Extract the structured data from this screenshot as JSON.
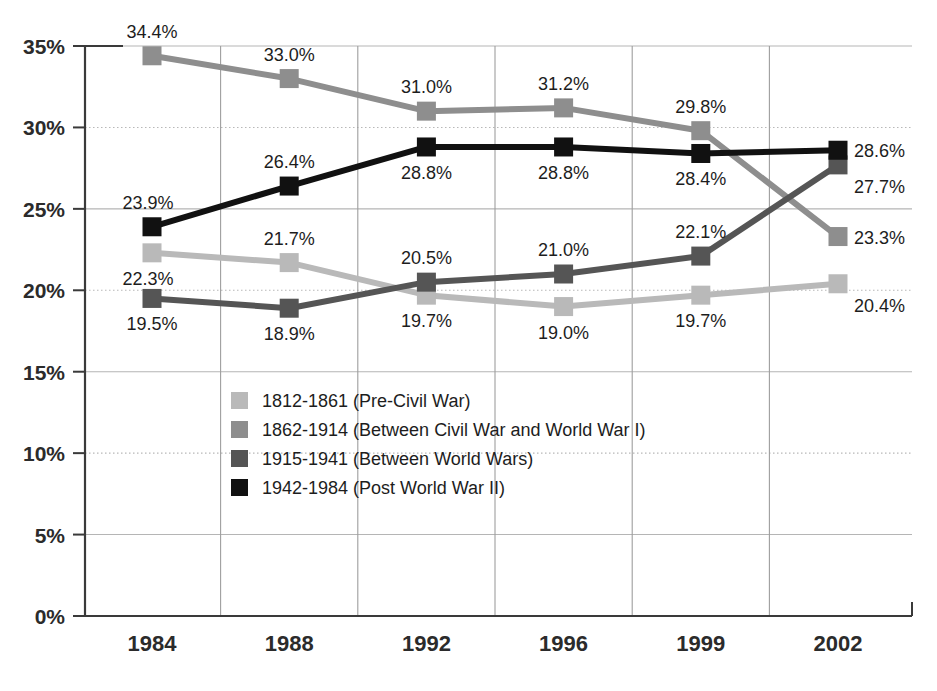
{
  "chart_data": {
    "type": "line",
    "title": "",
    "xlabel": "",
    "ylabel": "",
    "categories": [
      "1984",
      "1988",
      "1992",
      "1996",
      "1999",
      "2002"
    ],
    "ylim": [
      0,
      35
    ],
    "ytick_labels": [
      "0%",
      "5%",
      "10%",
      "15%",
      "20%",
      "25%",
      "30%",
      "35%"
    ],
    "ytick_values": [
      0,
      5,
      10,
      15,
      20,
      25,
      30,
      35
    ],
    "grid": "horizontal-and-vertical",
    "legend_position": "inside-center-left",
    "value_suffix": "%",
    "series": [
      {
        "name": "1812-1861 (Pre-Civil War)",
        "color": "#b9b9b9",
        "values": [
          22.3,
          21.7,
          19.7,
          19.0,
          19.7,
          20.4
        ],
        "labels": [
          "22.3%",
          "21.7%",
          "19.7%",
          "19.0%",
          "19.7%",
          "20.4%"
        ],
        "label_positions": [
          "below-left",
          "above",
          "below",
          "below",
          "below",
          "below-right"
        ]
      },
      {
        "name": "1862-1914 (Between Civil War and World War I)",
        "color": "#8e8e8e",
        "values": [
          34.4,
          33.0,
          31.0,
          31.2,
          29.8,
          23.3
        ],
        "labels": [
          "34.4%",
          "33.0%",
          "31.0%",
          "31.2%",
          "29.8%",
          "23.3%"
        ],
        "label_positions": [
          "above",
          "above",
          "above",
          "above",
          "above",
          "right"
        ]
      },
      {
        "name": "1915-1941 (Between World Wars)",
        "color": "#555555",
        "values": [
          19.5,
          18.9,
          20.5,
          21.0,
          22.1,
          27.7
        ],
        "labels": [
          "19.5%",
          "18.9%",
          "20.5%",
          "21.0%",
          "22.1%",
          "27.7%"
        ],
        "label_positions": [
          "below",
          "below",
          "above",
          "above",
          "above",
          "below-right"
        ]
      },
      {
        "name": "1942-1984 (Post World War II)",
        "color": "#111111",
        "values": [
          23.9,
          26.4,
          28.8,
          28.8,
          28.4,
          28.6
        ],
        "labels": [
          "23.9%",
          "26.4%",
          "28.8%",
          "28.8%",
          "28.4%",
          "28.6%"
        ],
        "label_positions": [
          "above-left",
          "above",
          "below",
          "below",
          "below",
          "right"
        ]
      }
    ]
  },
  "legend": {
    "items": [
      {
        "label": "1812-1861 (Pre-Civil War)",
        "color": "#b9b9b9"
      },
      {
        "label": "1862-1914 (Between Civil War and World War I)",
        "color": "#8e8e8e"
      },
      {
        "label": "1915-1941 (Between World Wars)",
        "color": "#555555"
      },
      {
        "label": "1942-1984 (Post World War II)",
        "color": "#111111"
      }
    ]
  }
}
